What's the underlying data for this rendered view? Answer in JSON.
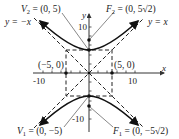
{
  "diagram": {
    "type": "hyperbola",
    "equation_form": "y^2/25 - x^2/25 = 1",
    "axes": {
      "x_label": "x",
      "y_label": "y",
      "x_ticks": [
        "-10",
        "10"
      ],
      "y_ticks": [
        "10",
        "-10"
      ]
    },
    "labels": {
      "v2": "V",
      "v2_sub": "2",
      "v2_rest": " = (0, 5)",
      "f2": "F",
      "f2_sub": "2",
      "f2_rest": " = (0, 5√2)",
      "v1": "V",
      "v1_sub": "1",
      "v1_rest": " = (0, −5)",
      "f1": "F",
      "f1_sub": "1",
      "f1_rest": " = (0, −5√2)",
      "asym_neg": "y = −x",
      "asym_pos": "y = x",
      "point_left": "(−5, 0)",
      "point_right": "(5, 0)"
    },
    "points": [
      {
        "name": "V2",
        "x": 0,
        "y": 5
      },
      {
        "name": "F2",
        "x": 0,
        "y": 7.07
      },
      {
        "name": "V1",
        "x": 0,
        "y": -5
      },
      {
        "name": "F1",
        "x": 0,
        "y": -7.07
      },
      {
        "name": "left",
        "x": -5,
        "y": 0
      },
      {
        "name": "right",
        "x": 5,
        "y": 0
      }
    ],
    "colors": {
      "curve": "#111111",
      "dashed": "#222222",
      "axis": "#333333",
      "leader": "#555555"
    }
  }
}
